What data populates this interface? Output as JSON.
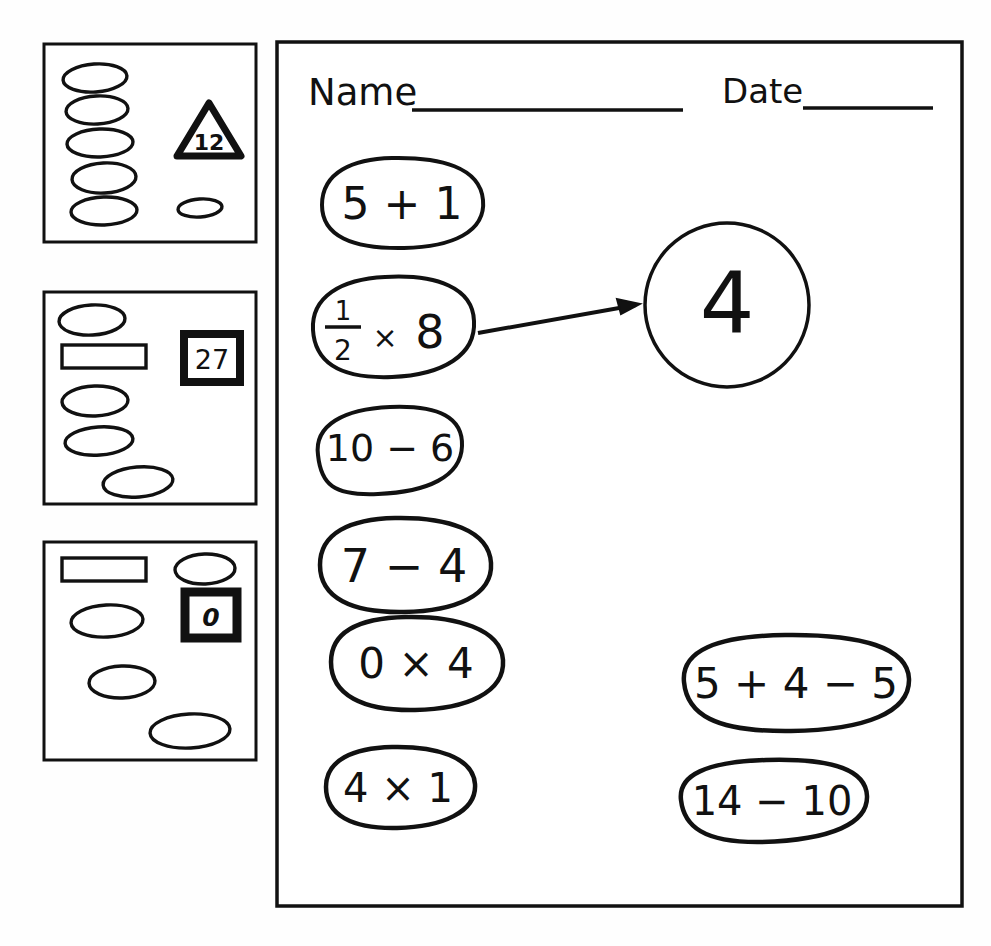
{
  "page": {
    "background_color": "#fefefe",
    "ink_color": "#111111",
    "width": 991,
    "height": 946
  },
  "panels": [
    {
      "id": "panel-1",
      "badge": {
        "label": "12",
        "shape": "triangle"
      },
      "shapes": [
        {
          "kind": "ellipse",
          "cx": 95,
          "cy": 78,
          "rx": 32,
          "ry": 14,
          "rot": -4
        },
        {
          "kind": "ellipse",
          "cx": 97,
          "cy": 110,
          "rx": 31,
          "ry": 14,
          "rot": -3
        },
        {
          "kind": "ellipse",
          "cx": 100,
          "cy": 143,
          "rx": 33,
          "ry": 14,
          "rot": -2
        },
        {
          "kind": "ellipse",
          "cx": 104,
          "cy": 178,
          "rx": 32,
          "ry": 15,
          "rot": -3
        },
        {
          "kind": "ellipse",
          "cx": 104,
          "cy": 211,
          "rx": 33,
          "ry": 14,
          "rot": -2
        },
        {
          "kind": "ellipse",
          "cx": 200,
          "cy": 208,
          "rx": 22,
          "ry": 9,
          "rot": -4
        }
      ]
    },
    {
      "id": "panel-2",
      "badge": {
        "label": "27",
        "shape": "square"
      },
      "shapes": [
        {
          "kind": "ellipse",
          "cx": 92,
          "cy": 320,
          "rx": 33,
          "ry": 15,
          "rot": -3
        },
        {
          "kind": "rectangle",
          "x": 62,
          "y": 345,
          "w": 84,
          "h": 23
        },
        {
          "kind": "ellipse",
          "cx": 95,
          "cy": 401,
          "rx": 33,
          "ry": 15,
          "rot": -2
        },
        {
          "kind": "ellipse",
          "cx": 99,
          "cy": 441,
          "rx": 34,
          "ry": 14,
          "rot": -4
        },
        {
          "kind": "ellipse",
          "cx": 138,
          "cy": 482,
          "rx": 35,
          "ry": 15,
          "rot": -5
        }
      ]
    },
    {
      "id": "panel-3",
      "badge": {
        "label": "0",
        "shape": "square"
      },
      "shapes": [
        {
          "kind": "rectangle",
          "x": 62,
          "y": 558,
          "w": 84,
          "h": 23
        },
        {
          "kind": "ellipse",
          "cx": 205,
          "cy": 569,
          "rx": 30,
          "ry": 15,
          "rot": -2
        },
        {
          "kind": "ellipse",
          "cx": 107,
          "cy": 621,
          "rx": 36,
          "ry": 16,
          "rot": -3
        },
        {
          "kind": "ellipse",
          "cx": 122,
          "cy": 682,
          "rx": 33,
          "ry": 16,
          "rot": -2
        },
        {
          "kind": "ellipse",
          "cx": 190,
          "cy": 731,
          "rx": 40,
          "ry": 17,
          "rot": -3
        }
      ]
    }
  ],
  "worksheet": {
    "header": {
      "name_label": "Name",
      "date_label": "Date"
    },
    "answer_bubble": {
      "value": "4",
      "shape": "circle"
    },
    "arrow": {
      "from": "half-times-eight-bubble",
      "to": "answer-bubble"
    },
    "left_column_expressions": [
      {
        "id": "expr-5-plus-1",
        "text": "5 + 1"
      },
      {
        "id": "expr-half-x-8",
        "text": "½ × 8",
        "numerator": "1",
        "denominator": "2",
        "operator": "×",
        "operand": "8"
      },
      {
        "id": "expr-10-minus-6",
        "text": "10 − 6"
      },
      {
        "id": "expr-7-minus-4",
        "text": "7 − 4"
      },
      {
        "id": "expr-0-times-4",
        "text": "0 × 4"
      },
      {
        "id": "expr-4-times-1",
        "text": "4 × 1"
      }
    ],
    "right_column_expressions": [
      {
        "id": "expr-5-plus-4-minus-5",
        "text": "5 + 4 − 5"
      },
      {
        "id": "expr-14-minus-10",
        "text": "14 − 10"
      }
    ]
  }
}
